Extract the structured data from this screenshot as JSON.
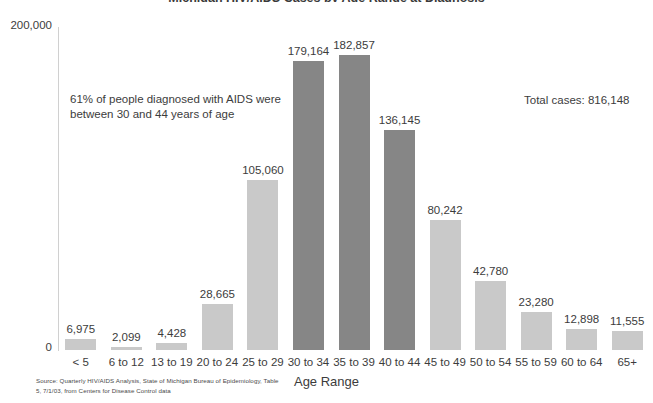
{
  "chart_data": {
    "type": "bar",
    "title": "Michigan HIV/AIDS Cases by Age Range at Diagnosis",
    "xlabel": "Age Range",
    "ylabel": "",
    "ylim": [
      0,
      200000
    ],
    "ytick_labels": [
      "200,000",
      "0"
    ],
    "grid": false,
    "legend": false,
    "categories": [
      "< 5",
      "6 to 12",
      "13 to 19",
      "20 to 24",
      "25 to 29",
      "30 to 34",
      "35 to 39",
      "40 to 44",
      "45 to 49",
      "50 to 54",
      "55 to 59",
      "60 to 64",
      "65+"
    ],
    "values": [
      6975,
      2099,
      4428,
      28665,
      105060,
      179164,
      182857,
      136145,
      80242,
      42780,
      23280,
      12898,
      11555
    ],
    "value_labels": [
      "6,975",
      "2,099",
      "4,428",
      "28,665",
      "105,060",
      "179,164",
      "182,857",
      "136,145",
      "80,242",
      "42,780",
      "23,280",
      "12,898",
      "11,555"
    ],
    "bar_colors": [
      "#c9c9c9",
      "#c9c9c9",
      "#c9c9c9",
      "#c9c9c9",
      "#c9c9c9",
      "#868686",
      "#868686",
      "#868686",
      "#c9c9c9",
      "#c9c9c9",
      "#c9c9c9",
      "#c9c9c9",
      "#c9c9c9"
    ],
    "highlight_color": "#868686",
    "base_color": "#c9c9c9",
    "annotations": [
      {
        "name": "percentage-note",
        "text": "61% of people diagnosed with AIDS were\nbetween 30 and 44 years of age"
      },
      {
        "name": "total-cases",
        "text": "Total cases: 816,148"
      }
    ]
  },
  "source": {
    "text": "Source: Quarterly HIV/AIDS Analysis, State of Michigan Bureau of Epidemiology, Table\n5, 7/1/03, from Centers for Disease Control data"
  }
}
